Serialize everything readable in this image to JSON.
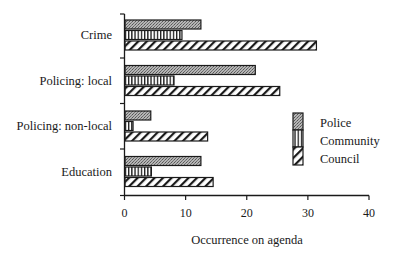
{
  "chart_data": {
    "type": "bar",
    "orientation": "horizontal",
    "title": "",
    "xlabel": "Occurrence on agenda",
    "ylabel": "",
    "xlim": [
      0,
      40
    ],
    "xticks": [
      0,
      10,
      20,
      30,
      40
    ],
    "grid": false,
    "legend_position": "right-center-inside",
    "categories": [
      "Crime",
      "Policing: local",
      "Policing: non-local",
      "Education"
    ],
    "series": [
      {
        "name": "Police",
        "pattern": "stipple",
        "values": [
          12.5,
          21.4,
          4.3,
          12.5
        ]
      },
      {
        "name": "Community",
        "pattern": "vertical-lines",
        "values": [
          9.4,
          8.1,
          1.4,
          4.4
        ]
      },
      {
        "name": "Council",
        "pattern": "diagonal-hatch",
        "values": [
          31.4,
          25.4,
          13.6,
          14.5
        ]
      }
    ]
  },
  "legend": {
    "items": [
      {
        "label": "Police"
      },
      {
        "label": "Community"
      },
      {
        "label": "Council"
      }
    ]
  },
  "axis": {
    "x_label": "Occurrence on agenda",
    "tick_labels": [
      "0",
      "10",
      "20",
      "30",
      "40"
    ]
  },
  "colors": {
    "ink": "#1a1a1a",
    "stipple": "#9a9a9a",
    "background": "#ffffff"
  }
}
